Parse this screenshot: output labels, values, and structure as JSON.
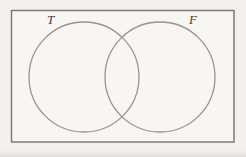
{
  "diagram": {
    "type": "venn",
    "sets": [
      {
        "label": "T",
        "position": "left"
      },
      {
        "label": "F",
        "position": "right"
      }
    ],
    "colors": {
      "background": "#f3f1ed",
      "universe_fill": "#f7f6f3",
      "universe_border": "#7d7b78",
      "circle_stroke": "#98958f",
      "label_text": "#413f3c"
    }
  }
}
